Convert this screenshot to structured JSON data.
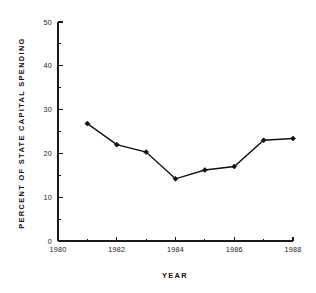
{
  "chart_data": {
    "type": "line",
    "title": "",
    "xlabel": "YEAR",
    "ylabel": "PERCENT OF STATE CAPITAL SPENDING",
    "x": [
      1981,
      1982,
      1983,
      1984,
      1985,
      1986,
      1987,
      1988
    ],
    "values": [
      26.8,
      22.0,
      20.3,
      14.2,
      16.2,
      17.0,
      23.0,
      23.4
    ],
    "series": [
      {
        "name": "Percent of state capital spending",
        "x": [
          1981,
          1982,
          1983,
          1984,
          1985,
          1986,
          1987,
          1988
        ],
        "values": [
          26.8,
          22.0,
          20.3,
          14.2,
          16.2,
          17.0,
          23.0,
          23.4
        ]
      }
    ],
    "xlim": [
      1980,
      1988
    ],
    "ylim": [
      0,
      50
    ],
    "x_ticks": [
      1980,
      1982,
      1984,
      1986,
      1988
    ],
    "x_tick_labels": [
      "1980",
      "1982",
      "1984",
      "1986",
      "1988"
    ],
    "x_minor_ticks": [
      1981,
      1983,
      1985,
      1987
    ],
    "y_ticks": [
      0,
      10,
      20,
      30,
      40,
      50
    ],
    "y_tick_labels": [
      "0",
      "10",
      "20",
      "30",
      "40",
      "50"
    ],
    "y_minor_ticks": [
      5,
      15,
      25,
      35,
      45
    ],
    "grid": false,
    "legend": "none",
    "marker": "filled-diamond",
    "line_color": "#111111",
    "marker_color": "#111111",
    "background_color": "#ffffff"
  }
}
